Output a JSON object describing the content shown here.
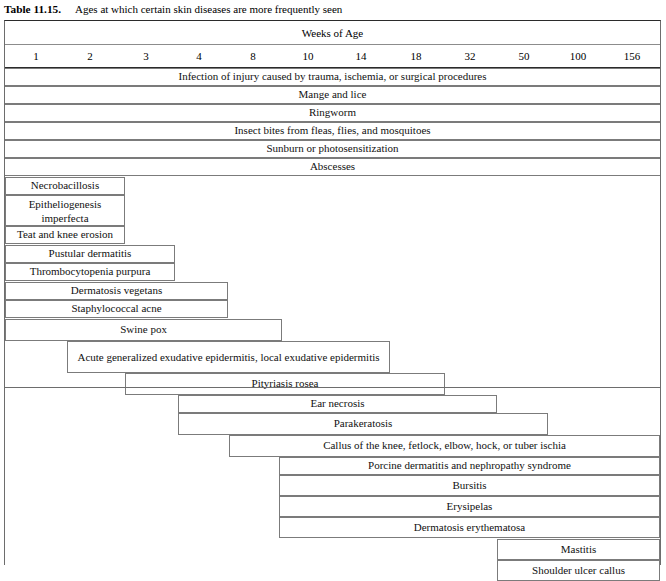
{
  "caption": {
    "label": "Table 11.15.",
    "text": "Ages at which certain skin diseases are more frequently seen"
  },
  "table": {
    "header_title": "Weeks of Age",
    "age_ticks": [
      "1",
      "2",
      "3",
      "4",
      "8",
      "10",
      "14",
      "18",
      "32",
      "50",
      "100",
      "156"
    ],
    "tick_positions": [
      31,
      85,
      141,
      194,
      248,
      303,
      356,
      411,
      465,
      519,
      573,
      627
    ],
    "rows": [
      {
        "label": "Infection of injury caused by trauma, ischemia, or surgical procedures",
        "start": 0,
        "end": 655,
        "full": true
      },
      {
        "label": "Mange and lice",
        "start": 0,
        "end": 655,
        "full": true
      },
      {
        "label": "Ringworm",
        "start": 0,
        "end": 655,
        "full": true
      },
      {
        "label": "Insect bites from fleas, flies, and mosquitoes",
        "start": 0,
        "end": 655,
        "full": true
      },
      {
        "label": "Sunburn or photosensitization",
        "start": 0,
        "end": 655,
        "full": true
      },
      {
        "label": "Abscesses",
        "start": 0,
        "end": 655,
        "full": true
      },
      {
        "label": "Necrobacillosis",
        "start": 0,
        "end": 120,
        "full": false
      },
      {
        "label": "Epitheliogenesis imperfecta",
        "start": 0,
        "end": 120,
        "full": false
      },
      {
        "label": "Teat and knee erosion",
        "start": 0,
        "end": 120,
        "full": false
      },
      {
        "label": "Pustular dermatitis",
        "start": 0,
        "end": 170,
        "full": false
      },
      {
        "label": "Thrombocytopenia purpura",
        "start": 0,
        "end": 170,
        "full": false
      },
      {
        "label": "Dermatosis vegetans",
        "start": 0,
        "end": 223,
        "full": false
      },
      {
        "label": "Staphylococcal acne",
        "start": 0,
        "end": 223,
        "full": false
      },
      {
        "label": "Swine pox",
        "start": 0,
        "end": 277,
        "full": false
      },
      {
        "label": "Acute generalized exudative epidermitis, local exudative epidermitis",
        "start": 62,
        "end": 385,
        "full": false
      },
      {
        "label": "Pityriasis rosea",
        "start": 120,
        "end": 440,
        "full": false
      },
      {
        "label": "Ear necrosis",
        "start": 173,
        "end": 492,
        "full": false
      },
      {
        "label": "Parakeratosis",
        "start": 173,
        "end": 543,
        "full": false
      },
      {
        "label": "Callus of the knee, fetlock, elbow, hock, or tuber ischia",
        "start": 224,
        "end": 655,
        "full": false
      },
      {
        "label": "Porcine dermatitis and nephropathy syndrome",
        "start": 274,
        "end": 655,
        "full": false
      },
      {
        "label": "Bursitis",
        "start": 274,
        "end": 655,
        "full": false
      },
      {
        "label": "Erysipelas",
        "start": 274,
        "end": 655,
        "full": false
      },
      {
        "label": "Dermatosis erythematosa",
        "start": 274,
        "end": 655,
        "full": false
      },
      {
        "label": "Mastitis",
        "start": 492,
        "end": 655,
        "full": false
      },
      {
        "label": "Shoulder ulcer callus",
        "start": 492,
        "end": 655,
        "full": false
      }
    ]
  },
  "chart_data": {
    "type": "table",
    "title": "Ages at which certain skin diseases are more frequently seen",
    "xlabel": "Weeks of Age",
    "categories": [
      "1",
      "2",
      "3",
      "4",
      "8",
      "10",
      "14",
      "18",
      "32",
      "50",
      "100",
      "156"
    ],
    "series": [
      {
        "name": "Infection of injury caused by trauma, ischemia, or surgical procedures",
        "week_start": 1,
        "week_end": 156
      },
      {
        "name": "Mange and lice",
        "week_start": 1,
        "week_end": 156
      },
      {
        "name": "Ringworm",
        "week_start": 1,
        "week_end": 156
      },
      {
        "name": "Insect bites from fleas, flies, and mosquitoes",
        "week_start": 1,
        "week_end": 156
      },
      {
        "name": "Sunburn or photosensitization",
        "week_start": 1,
        "week_end": 156
      },
      {
        "name": "Abscesses",
        "week_start": 1,
        "week_end": 156
      },
      {
        "name": "Necrobacillosis",
        "week_start": 1,
        "week_end": 2
      },
      {
        "name": "Epitheliogenesis imperfecta",
        "week_start": 1,
        "week_end": 2
      },
      {
        "name": "Teat and knee erosion",
        "week_start": 1,
        "week_end": 2
      },
      {
        "name": "Pustular dermatitis",
        "week_start": 1,
        "week_end": 3
      },
      {
        "name": "Thrombocytopenia purpura",
        "week_start": 1,
        "week_end": 3
      },
      {
        "name": "Dermatosis vegetans",
        "week_start": 1,
        "week_end": 4
      },
      {
        "name": "Staphylococcal acne",
        "week_start": 1,
        "week_end": 4
      },
      {
        "name": "Swine pox",
        "week_start": 1,
        "week_end": 8
      },
      {
        "name": "Acute generalized exudative epidermitis, local exudative epidermitis",
        "week_start": 2,
        "week_end": 18
      },
      {
        "name": "Pityriasis rosea",
        "week_start": 3,
        "week_end": 32
      },
      {
        "name": "Ear necrosis",
        "week_start": 4,
        "week_end": 50
      },
      {
        "name": "Parakeratosis",
        "week_start": 4,
        "week_end": 100
      },
      {
        "name": "Callus of the knee, fetlock, elbow, hock, or tuber ischia",
        "week_start": 8,
        "week_end": 156
      },
      {
        "name": "Porcine dermatitis and nephropathy syndrome",
        "week_start": 10,
        "week_end": 156
      },
      {
        "name": "Bursitis",
        "week_start": 10,
        "week_end": 156
      },
      {
        "name": "Erysipelas",
        "week_start": 10,
        "week_end": 156
      },
      {
        "name": "Dermatosis erythematosa",
        "week_start": 10,
        "week_end": 156
      },
      {
        "name": "Mastitis",
        "week_start": 50,
        "week_end": 156
      },
      {
        "name": "Shoulder ulcer callus",
        "week_start": 50,
        "week_end": 156
      }
    ]
  }
}
